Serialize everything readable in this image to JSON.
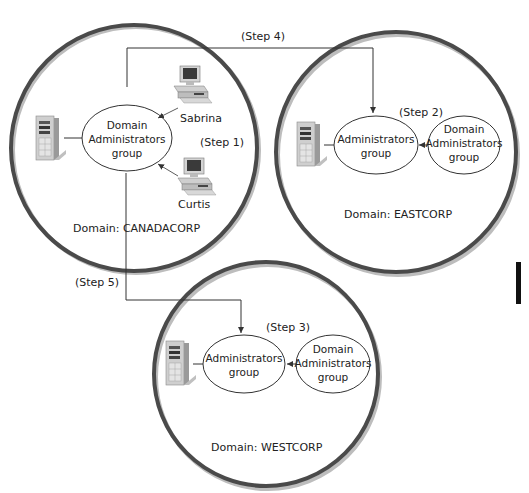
{
  "diagram": {
    "domains": [
      {
        "id": "canadacorp",
        "label": "Domain: CANADACORP",
        "group": [
          "Domain",
          "Administrators",
          "group"
        ],
        "users": [
          {
            "name": "Sabrina",
            "icon": "desktop-computer-icon"
          },
          {
            "name": "Curtis",
            "icon": "desktop-computer-icon"
          }
        ],
        "step": "(Step 1)",
        "server_icon": "server-tower-icon"
      },
      {
        "id": "eastcorp",
        "label": "Domain: EASTCORP",
        "local_group": [
          "Administrators",
          "group"
        ],
        "domain_group": [
          "Domain",
          "Administrators",
          "group"
        ],
        "step": "(Step 2)",
        "server_icon": "server-tower-icon"
      },
      {
        "id": "westcorp",
        "label": "Domain: WESTCORP",
        "local_group": [
          "Administrators",
          "group"
        ],
        "domain_group": [
          "Domain",
          "Administrators",
          "group"
        ],
        "step": "(Step 3)",
        "server_icon": "server-tower-icon"
      }
    ],
    "connectors": [
      {
        "label": "(Step 4)",
        "from": "canadacorp",
        "to": "eastcorp"
      },
      {
        "label": "(Step 5)",
        "from": "canadacorp",
        "to": "westcorp"
      }
    ],
    "colors": {
      "ring": "#4a4a4a",
      "ring_shadow": "#b8b8b8",
      "line": "#333333",
      "server_body": "#c9c9c9",
      "screen": "#3a3a3a"
    }
  }
}
